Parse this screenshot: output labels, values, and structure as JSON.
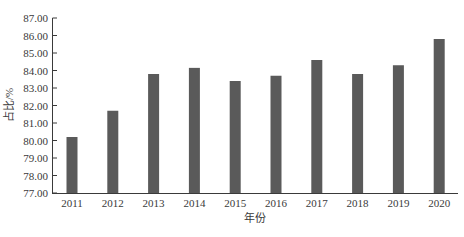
{
  "chart_data": {
    "type": "bar",
    "title": "",
    "xlabel": "年份",
    "ylabel": "占比/%",
    "categories": [
      "2011",
      "2012",
      "2013",
      "2014",
      "2015",
      "2016",
      "2017",
      "2018",
      "2019",
      "2020"
    ],
    "values": [
      80.2,
      81.7,
      83.8,
      84.15,
      83.4,
      83.7,
      84.6,
      83.8,
      84.3,
      85.8
    ],
    "ylim": [
      77.0,
      87.0
    ],
    "yticks": [
      "77.00",
      "78.00",
      "79.00",
      "80.00",
      "81.00",
      "82.00",
      "83.00",
      "84.00",
      "85.00",
      "86.00",
      "87.00"
    ],
    "grid": false,
    "legend": null,
    "bar_color": "#5a5a5a",
    "axis_color": "#3a3a3a"
  }
}
